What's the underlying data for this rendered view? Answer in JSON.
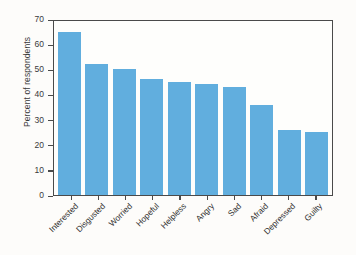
{
  "chart_data": {
    "type": "bar",
    "title": "",
    "xlabel": "",
    "ylabel": "Percent of respondents",
    "categories": [
      "Interested",
      "Disgusted",
      "Worried",
      "Hopeful",
      "Helpless",
      "Angry",
      "Sad",
      "Afraid",
      "Depressed",
      "Guilty"
    ],
    "values": [
      65,
      52,
      50,
      46,
      45,
      44,
      43,
      36,
      26,
      25
    ],
    "ylim": [
      0,
      70
    ],
    "yticks": [
      0,
      10,
      20,
      30,
      40,
      50,
      60,
      70
    ],
    "ytick_labels": [
      "0",
      "10",
      "20",
      "30",
      "40",
      "50",
      "60",
      "70"
    ],
    "grid": false,
    "legend": false,
    "bar_color": "#61aede",
    "frame_color": "#4a4a4a",
    "background_color": "#fefefc"
  }
}
